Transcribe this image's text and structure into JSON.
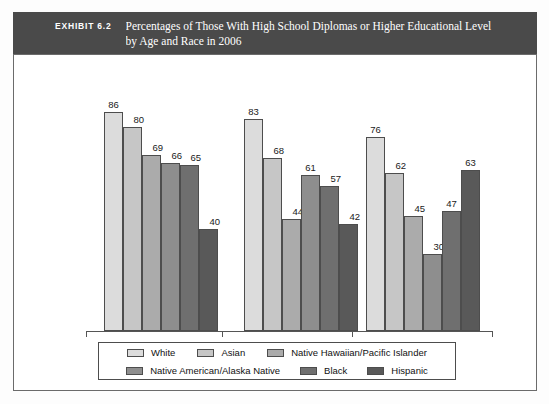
{
  "exhibit": {
    "label": "EXHIBIT 6.2",
    "title_line1": "Percentages of Those With High School Diplomas or Higher Educational Level",
    "title_line2": "by Age and Race in 2006",
    "bar_color": "#4a4a4a",
    "text_color": "#ffffff"
  },
  "chart_data": {
    "type": "bar",
    "title": "Percentages of Those With High School Diplomas or Higher Educational Level by Age and Race in 2006",
    "xlabel": "",
    "ylabel": "",
    "ylim": [
      0,
      100
    ],
    "grid": false,
    "legend_position": "bottom",
    "categories": [
      "65–69",
      "70–74",
      "75+"
    ],
    "series": [
      {
        "name": "White",
        "color": "#dcdcdc",
        "values": [
          86,
          83,
          76
        ]
      },
      {
        "name": "Asian",
        "color": "#c6c6c6",
        "values": [
          80,
          68,
          62
        ]
      },
      {
        "name": "Native Hawaiian/Pacific Islander",
        "color": "#ababab",
        "values": [
          69,
          44,
          45
        ]
      },
      {
        "name": "Native American/Alaska Native",
        "color": "#8e8e8e",
        "values": [
          66,
          61,
          30
        ]
      },
      {
        "name": "Black",
        "color": "#6f6f6f",
        "values": [
          65,
          57,
          47
        ]
      },
      {
        "name": "Hispanic",
        "color": "#595959",
        "values": [
          40,
          42,
          63
        ]
      }
    ]
  },
  "legend": {
    "row1": [
      "White",
      "Asian",
      "Native Hawaiian/Pacific Islander"
    ],
    "row2": [
      "Native American/Alaska Native",
      "Black",
      "Hispanic"
    ]
  },
  "axis": {
    "tick_labels": [
      "65–69",
      "70–74",
      "75+"
    ]
  }
}
